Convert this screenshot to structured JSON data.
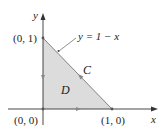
{
  "diagram": {
    "type": "region-with-boundary-curve",
    "axes": {
      "x_label": "x",
      "y_label": "y"
    },
    "points": {
      "origin": "(0, 0)",
      "y_intercept": "(0, 1)",
      "x_intercept": "(1, 0)"
    },
    "curve_equation": "y = 1 − x",
    "boundary_label": "C",
    "region_label": "D",
    "orientation": "counterclockwise",
    "colors": {
      "region_fill": "#dcdcdc",
      "axis": "#333333",
      "boundary": "#555555",
      "text": "#222222"
    }
  }
}
